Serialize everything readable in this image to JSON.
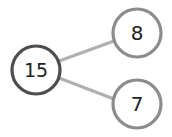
{
  "diagram": {
    "type": "number-bond",
    "whole": {
      "label": "15",
      "cx": 36,
      "cy": 70,
      "r": 24,
      "stroke": "#4d4d4d"
    },
    "parts": [
      {
        "label": "8",
        "cx": 137,
        "cy": 33,
        "r": 24,
        "stroke": "#8c8c8c"
      },
      {
        "label": "7",
        "cx": 137,
        "cy": 104,
        "r": 24,
        "stroke": "#8c8c8c"
      }
    ],
    "connector_color": "#b0b0b0"
  }
}
